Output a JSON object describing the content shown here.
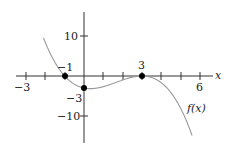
{
  "chart_data": {
    "type": "line",
    "title": "",
    "function_label": "f(x)",
    "formula": "f(x) = -(1/3)(x+1)(x-3)^2",
    "xlabel": "x",
    "ylabel": "",
    "x_tick_labels": [
      "-3",
      "6"
    ],
    "y_tick_labels": [
      "10",
      "-10"
    ],
    "xlim": [
      -3.5,
      6.5
    ],
    "ylim": [
      -17,
      21
    ],
    "grid": false,
    "marked_points": [
      {
        "x": -1,
        "y": 0,
        "label": "-1"
      },
      {
        "x": 0,
        "y": -3,
        "label": "-3"
      },
      {
        "x": 3,
        "y": 0,
        "label": "3"
      }
    ],
    "colors": {
      "curve": "#999999",
      "axes": "#333333",
      "points": "#000000"
    }
  },
  "labels": {
    "x_axis": "x",
    "x_neg3": "−3",
    "x_6": "6",
    "y_10": "10",
    "y_neg10": "−10",
    "pt_neg1": "−1",
    "pt_neg3": "−3",
    "pt_3": "3",
    "func": "f(x)"
  }
}
